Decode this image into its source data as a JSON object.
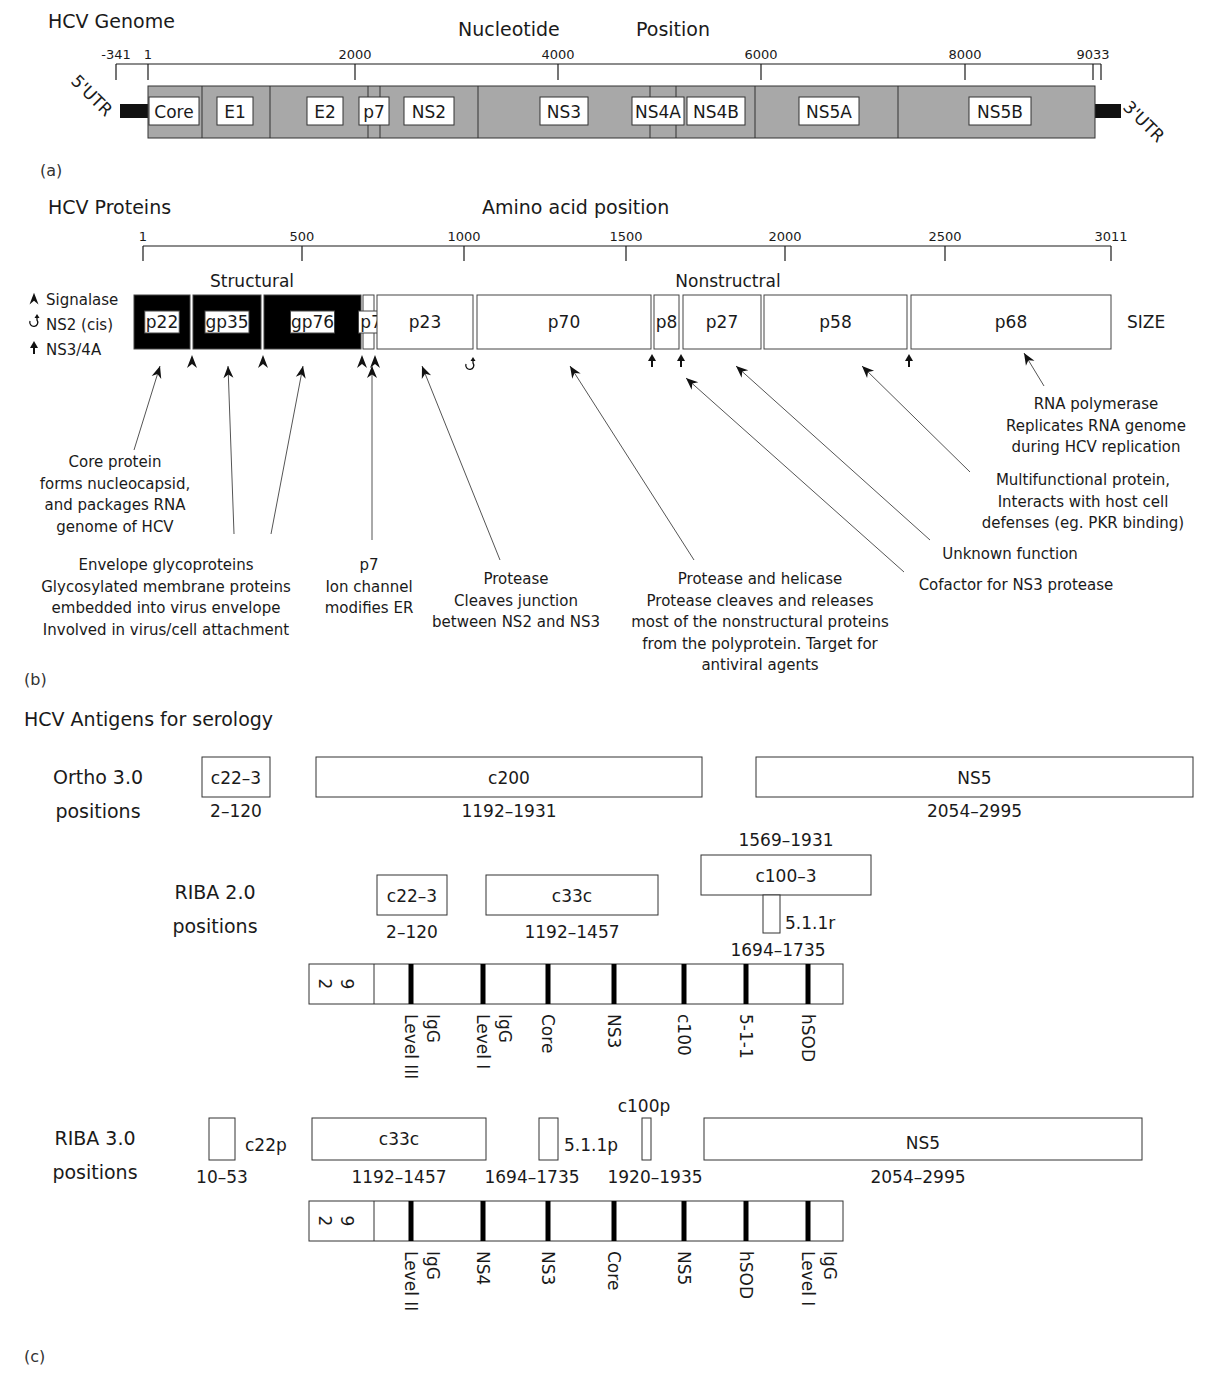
{
  "panel_a": {
    "title": "HCV Genome",
    "axis_title": [
      "Nucleotide",
      "Position"
    ],
    "ticks": [
      {
        "label": "-341",
        "x": 116
      },
      {
        "label": "1",
        "x": 148
      },
      {
        "label": "2000",
        "x": 355
      },
      {
        "label": "4000",
        "x": 558
      },
      {
        "label": "6000",
        "x": 761
      },
      {
        "label": "8000",
        "x": 965
      },
      {
        "label": "9033",
        "x": 1093
      },
      {
        "label": "",
        "x": 1101
      }
    ],
    "utr5": "5'UTR",
    "utr3": "3'UTR",
    "bar": {
      "x0": 148,
      "x1": 1095,
      "y": 86,
      "h": 52,
      "color": "#a8a8a8"
    },
    "dividers": [
      202,
      270,
      368,
      380,
      478,
      650,
      676,
      755,
      898
    ],
    "segments": [
      {
        "label": "Core",
        "cx": 174,
        "w": 50
      },
      {
        "label": "E1",
        "cx": 235,
        "w": 36
      },
      {
        "label": "E2",
        "cx": 325,
        "w": 36
      },
      {
        "label": "p7",
        "cx": 374,
        "w": 30
      },
      {
        "label": "NS2",
        "cx": 429,
        "w": 50
      },
      {
        "label": "NS3",
        "cx": 564,
        "w": 48
      },
      {
        "label": "NS4A",
        "cx": 658,
        "w": 52
      },
      {
        "label": "NS4B",
        "cx": 716,
        "w": 58
      },
      {
        "label": "NS5A",
        "cx": 829,
        "w": 60
      },
      {
        "label": "NS5B",
        "cx": 1000,
        "w": 62
      }
    ],
    "panel_label": "(a)"
  },
  "panel_b": {
    "title": "HCV Proteins",
    "axis_title": "Amino acid position",
    "ticks": [
      {
        "label": "1",
        "x": 143
      },
      {
        "label": "500",
        "x": 302
      },
      {
        "label": "1000",
        "x": 464
      },
      {
        "label": "1500",
        "x": 626
      },
      {
        "label": "2000",
        "x": 785
      },
      {
        "label": "2500",
        "x": 945
      },
      {
        "label": "3011",
        "x": 1111
      }
    ],
    "group_labels": [
      {
        "label": "Structural",
        "x": 252
      },
      {
        "label": "Nonstructral",
        "x": 728
      }
    ],
    "legend": [
      {
        "symbol": "signalase",
        "label": "Signalase"
      },
      {
        "symbol": "ns2cis",
        "label": "NS2 (cis)"
      },
      {
        "symbol": "ns34a",
        "label": "NS3/4A"
      }
    ],
    "size_label": "SIZE",
    "proteins": [
      {
        "label": "p22",
        "x0": 134,
        "x1": 190,
        "fill": "black",
        "boxed": true
      },
      {
        "label": "gp35",
        "x0": 193,
        "x1": 261,
        "fill": "black",
        "boxed": true
      },
      {
        "label": "gp76",
        "x0": 264,
        "x1": 361,
        "fill": "black",
        "boxed": true
      },
      {
        "label": "p7",
        "x0": 363,
        "x1": 374,
        "fill": "white",
        "boxed": true,
        "label_cx": 371
      },
      {
        "label": "p23",
        "x0": 377,
        "x1": 473,
        "fill": "white"
      },
      {
        "label": "p70",
        "x0": 477,
        "x1": 651,
        "fill": "white"
      },
      {
        "label": "p8",
        "x0": 654,
        "x1": 679,
        "fill": "white"
      },
      {
        "label": "p27",
        "x0": 683,
        "x1": 761,
        "fill": "white"
      },
      {
        "label": "p58",
        "x0": 764,
        "x1": 907,
        "fill": "white"
      },
      {
        "label": "p68",
        "x0": 911,
        "x1": 1111,
        "fill": "white"
      }
    ],
    "cleavage_marks": [
      {
        "type": "signalase",
        "x": 192
      },
      {
        "type": "signalase",
        "x": 263
      },
      {
        "type": "signalase",
        "x": 362
      },
      {
        "type": "signalase",
        "x": 375
      },
      {
        "type": "ns2cis",
        "x": 470
      },
      {
        "type": "ns34a",
        "x": 652
      },
      {
        "type": "ns34a",
        "x": 681
      },
      {
        "type": "ns34a",
        "x": 909
      }
    ],
    "annotations": [
      {
        "lines": [
          "Core protein",
          "forms nucleocapsid,",
          "and packages RNA",
          "genome of HCV"
        ],
        "cx": 115,
        "y": 467
      },
      {
        "lines": [
          "Envelope glycoproteins",
          "Glycosylated membrane proteins",
          "embedded into virus envelope",
          "Involved in virus/cell attachment"
        ],
        "cx": 166,
        "y": 570
      },
      {
        "lines": [
          "p7",
          "Ion channel",
          "modifies ER"
        ],
        "cx": 369,
        "y": 570
      },
      {
        "lines": [
          "Protease",
          "Cleaves junction",
          "between NS2 and NS3"
        ],
        "cx": 516,
        "y": 584
      },
      {
        "lines": [
          "Protease and helicase",
          "Protease cleaves and releases",
          "most of the nonstructural proteins",
          "from the polyprotein. Target for",
          "antiviral agents"
        ],
        "cx": 760,
        "y": 584
      },
      {
        "lines": [
          "Cofactor for NS3 protease"
        ],
        "cx": 1016,
        "y": 590
      },
      {
        "lines": [
          "Unknown function"
        ],
        "cx": 1010,
        "y": 559
      },
      {
        "lines": [
          "Multifunctional protein,",
          "Interacts with host cell",
          "defenses (eg. PKR binding)"
        ],
        "cx": 1083,
        "y": 485
      },
      {
        "lines": [
          "RNA polymerase",
          "Replicates RNA genome",
          "during HCV replication"
        ],
        "cx": 1096,
        "y": 409
      }
    ],
    "pointer_lines": [
      {
        "x1": 134,
        "y1": 450,
        "x2": 160,
        "y2": 366
      },
      {
        "x1": 234,
        "y1": 534,
        "x2": 228,
        "y2": 366
      },
      {
        "x1": 271,
        "y1": 534,
        "x2": 303,
        "y2": 366
      },
      {
        "x1": 372,
        "y1": 540,
        "x2": 372,
        "y2": 366
      },
      {
        "x1": 500,
        "y1": 560,
        "x2": 422,
        "y2": 366
      },
      {
        "x1": 694,
        "y1": 560,
        "x2": 570,
        "y2": 366
      },
      {
        "x1": 904,
        "y1": 572,
        "x2": 686,
        "y2": 378
      },
      {
        "x1": 930,
        "y1": 540,
        "x2": 736,
        "y2": 366
      },
      {
        "x1": 970,
        "y1": 472,
        "x2": 862,
        "y2": 366
      },
      {
        "x1": 1044,
        "y1": 386,
        "x2": 1024,
        "y2": 353
      }
    ],
    "panel_label": "(b)"
  },
  "panel_c": {
    "title": "HCV Antigens for serology",
    "ortho": {
      "label": [
        "Ortho 3.0",
        "positions"
      ],
      "antigens": [
        {
          "label": "c22-3",
          "pos": "2-120",
          "x0": 202,
          "x1": 270,
          "label_inside": true
        },
        {
          "label": "c200",
          "pos": "1192-1931",
          "x0": 316,
          "x1": 702,
          "label_inside": true
        },
        {
          "label": "NS5",
          "pos": "2054-2995",
          "x0": 756,
          "x1": 1193,
          "label_inside": true
        }
      ]
    },
    "riba2": {
      "label": [
        "RIBA 2.0",
        "positions"
      ],
      "antigens": [
        {
          "label": "c22-3",
          "pos": "2-120",
          "x0": 377,
          "x1": 447
        },
        {
          "label": "c33c",
          "pos": "1192-1457",
          "x0": 486,
          "x1": 658
        },
        {
          "label": "c100-3",
          "pos": "1569-1931",
          "x0": 701,
          "x1": 871
        },
        {
          "label": "5.1.1r",
          "pos": "1694-1735",
          "x0": 763,
          "x1": 780
        }
      ],
      "strip": {
        "numbers": [
          "2",
          "9"
        ],
        "bands": [
          {
            "label": [
              "IgG",
              "Level III"
            ],
            "x": 411
          },
          {
            "label": [
              "IgG",
              "Level I"
            ],
            "x": 483
          },
          {
            "label": [
              "Core"
            ],
            "x": 548
          },
          {
            "label": [
              "NS3"
            ],
            "x": 614
          },
          {
            "label": [
              "c100"
            ],
            "x": 684
          },
          {
            "label": [
              "5-1-1"
            ],
            "x": 746
          },
          {
            "label": [
              "hSOD"
            ],
            "x": 808
          }
        ]
      }
    },
    "riba3": {
      "label": [
        "RIBA 3.0",
        "positions"
      ],
      "antigens": [
        {
          "label": "c22p",
          "pos": "10-53",
          "x0": 209,
          "x1": 235
        },
        {
          "label": "c33c",
          "pos": "1192-1457",
          "x0": 312,
          "x1": 486
        },
        {
          "label": "5.1.1p",
          "pos": "1694-1735",
          "x0": 539,
          "x1": 558
        },
        {
          "label": "c100p",
          "pos": "1920-1935",
          "x0": 642,
          "x1": 651
        },
        {
          "label": "NS5",
          "pos": "2054-2995",
          "x0": 704,
          "x1": 1142
        }
      ],
      "strip": {
        "numbers": [
          "2",
          "9"
        ],
        "bands": [
          {
            "label": [
              "IgG",
              "Level II"
            ],
            "x": 411
          },
          {
            "label": [
              "NS4"
            ],
            "x": 483
          },
          {
            "label": [
              "NS3"
            ],
            "x": 548
          },
          {
            "label": [
              "Core"
            ],
            "x": 614
          },
          {
            "label": [
              "NS5"
            ],
            "x": 684
          },
          {
            "label": [
              "hSOD"
            ],
            "x": 746
          },
          {
            "label": [
              "IgG",
              "Level I"
            ],
            "x": 808
          }
        ]
      }
    },
    "panel_label": "(c)"
  },
  "colors": {
    "genome_bar": "#a8a8a8",
    "ink": "#1a1a1a",
    "pointer": "#555555",
    "structural": "#000000"
  }
}
